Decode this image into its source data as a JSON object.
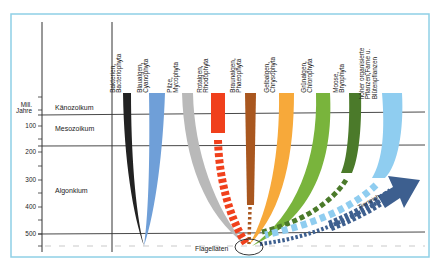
{
  "diagram": {
    "axis_unit": "Mill.\nJahre",
    "axis_unit_line1": "Mill.",
    "axis_unit_line2": "Jahre",
    "ticks": [
      "100",
      "200",
      "300",
      "400",
      "500"
    ],
    "eras": {
      "kaenozoikum": "Känozoikum",
      "mesozoikum": "Mesozoikum",
      "algonkium": "Algonkium"
    },
    "groups": [
      {
        "line1": "Bakterien,",
        "line2": "Bacteriophyta",
        "line3": "",
        "color": "#222222"
      },
      {
        "line1": "Blaualgen,",
        "line2": "Cyanophyta",
        "line3": "",
        "color": "#6f9fd8"
      },
      {
        "line1": "Pilze,",
        "line2": "Mycophyta",
        "line3": "",
        "color": "#b9b9b9"
      },
      {
        "line1": "Rotalgen,",
        "line2": "Rhodophyta",
        "line3": "",
        "color": "#f0401c"
      },
      {
        "line1": "Braunalgen,",
        "line2": "Phaeophyta",
        "line3": "",
        "color": "#a9571f"
      },
      {
        "line1": "Gelbalgen,",
        "line2": "Chrysophyta",
        "line3": "",
        "color": "#f7a93a"
      },
      {
        "line1": "Grünalgen,",
        "line2": "Chlorophyta",
        "line3": "",
        "color": "#79b43c"
      },
      {
        "line1": "Moose,",
        "line2": "Bryophyta",
        "line3": "",
        "color": "#4b7a2a"
      },
      {
        "line1": "höher organisierte",
        "line2": "Pflanzen,Farne u.",
        "line3": "Blütenpflanzen",
        "color": "#8fcdf0"
      }
    ],
    "origin_label": "Flagellaten",
    "animal_label": "Tierreich",
    "colors": {
      "frame": "#8fd0e6",
      "animal_arrow": "#3d5f8f",
      "lines": "#333333"
    }
  }
}
